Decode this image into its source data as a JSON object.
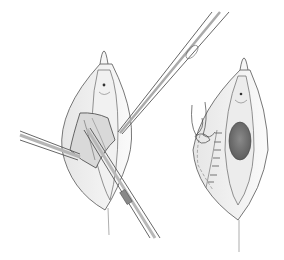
{
  "figure": {
    "type": "surgical-illustration",
    "panels": [
      {
        "id": "left",
        "subject": "dissection-with-instruments",
        "instruments": [
          "forceps-upper-right",
          "forceps-left",
          "scissors-lower"
        ]
      },
      {
        "id": "right",
        "subject": "sutured-closure"
      }
    ],
    "colors": {
      "background": "#ffffff",
      "outline": "#555555",
      "tissue": "#f4f4f4",
      "shadow": "#cfcfcf",
      "dark_mass": "#707070"
    }
  }
}
